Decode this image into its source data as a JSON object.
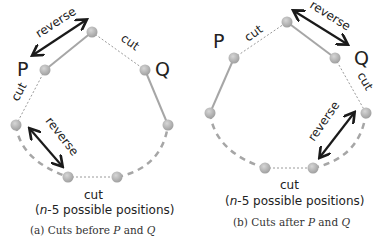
{
  "panels": [
    {
      "id": "a",
      "labels": {
        "P": "P",
        "Q": "Q",
        "reverse_top": "reverse",
        "reverse_bottom": "reverse",
        "cut_top": "cut",
        "cut_left": "cut",
        "cut_bottom": "cut",
        "positions_prefix": "(",
        "positions_n": "n",
        "positions_suffix": "-5 possible positions)"
      },
      "caption": {
        "prefix": "(a) Cuts before ",
        "P": "P",
        "mid": " and ",
        "Q": "Q"
      }
    },
    {
      "id": "b",
      "labels": {
        "P": "P",
        "Q": "Q",
        "reverse_top": "reverse",
        "reverse_right": "reverse",
        "cut_top": "cut",
        "cut_right": "cut",
        "cut_bottom": "cut",
        "positions_prefix": "(",
        "positions_n": "n",
        "positions_suffix": "-5 possible positions)"
      },
      "caption": {
        "prefix": "(b) Cuts after ",
        "P": "P",
        "mid": " and ",
        "Q": "Q"
      }
    }
  ],
  "colors": {
    "node": "#b3b3b3",
    "edge": "#a6a6a6",
    "arrow": "#1a1a1a",
    "text": "#222222"
  }
}
